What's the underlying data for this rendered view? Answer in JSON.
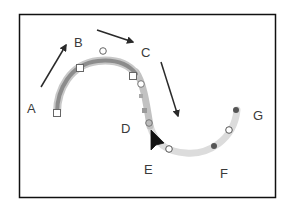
{
  "diagram": {
    "type": "curve-path-illustration",
    "frame": {
      "stroke": "#111111"
    },
    "labels": [
      {
        "id": "A",
        "text": "A",
        "x": 32,
        "y": 113
      },
      {
        "id": "B",
        "text": "B",
        "x": 74,
        "y": 47
      },
      {
        "id": "C",
        "text": "C",
        "x": 141,
        "y": 57
      },
      {
        "id": "D",
        "text": "D",
        "x": 121,
        "y": 133
      },
      {
        "id": "E",
        "text": "E",
        "x": 144,
        "y": 174
      },
      {
        "id": "F",
        "text": "F",
        "x": 220,
        "y": 178
      },
      {
        "id": "G",
        "text": "G",
        "x": 253,
        "y": 120
      }
    ],
    "arrows": [
      {
        "id": "arrow-a-to-b",
        "from": [
          41,
          87
        ],
        "to": [
          66,
          45
        ]
      },
      {
        "id": "arrow-b-to-c",
        "from": [
          97,
          30
        ],
        "to": [
          133,
          42
        ]
      },
      {
        "id": "arrow-c-down",
        "from": [
          161,
          62
        ],
        "to": [
          178,
          116
        ]
      }
    ],
    "colors": {
      "stroke_dark": "#8c8c8c",
      "stroke_mid": "#b8b8b8",
      "stroke_light": "#dcdcdc",
      "arrow": "#2a2a2a",
      "dot_dark": "#555555",
      "marker_fill": "#ffffff",
      "marker_stroke": "#555555"
    }
  }
}
